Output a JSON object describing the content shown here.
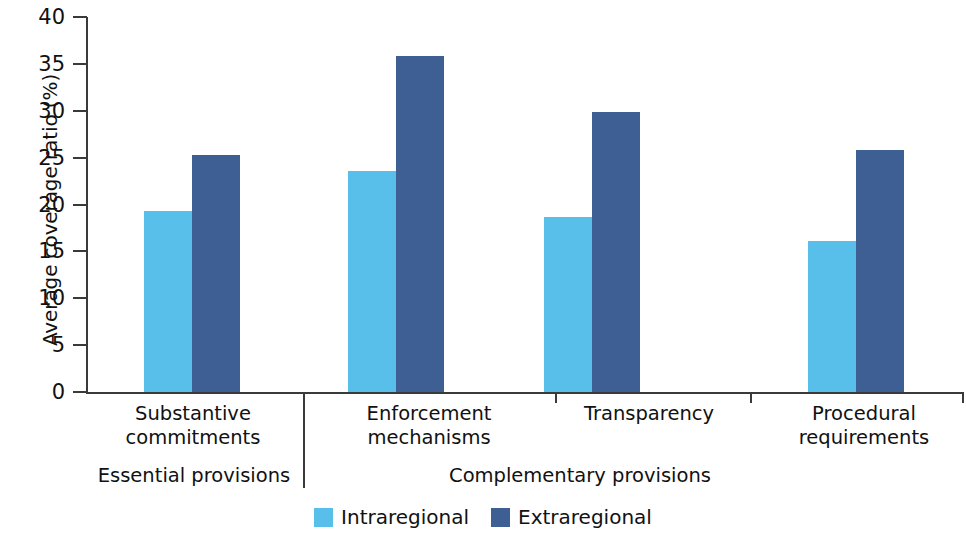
{
  "chart_data": {
    "type": "bar",
    "title": "",
    "subtitle": "",
    "xlabel": "",
    "ylabel": "Average coverage ratio (%)",
    "ylim": [
      0,
      40
    ],
    "ytick_step": 5,
    "yticks": [
      0,
      5,
      10,
      15,
      20,
      25,
      30,
      35,
      40
    ],
    "ytick_labels": [
      "0",
      "5",
      "10",
      "15",
      "20",
      "25",
      "30",
      "35",
      "40"
    ],
    "grid": false,
    "legend_position": "bottom-center",
    "categories": [
      "Substantive commitments",
      "Enforcement mechanisms",
      "Transparency",
      "Procedural requirements"
    ],
    "category_lines": [
      [
        "Substantive",
        "commitments"
      ],
      [
        "Enforcement",
        "mechanisms"
      ],
      [
        "Transparency"
      ],
      [
        "Procedural",
        "requirements"
      ]
    ],
    "series": [
      {
        "name": "Intraregional",
        "color": "#57bfea",
        "values": [
          19.4,
          23.6,
          18.7,
          16.2
        ]
      },
      {
        "name": "Extraregional",
        "color": "#3d5f94",
        "values": [
          25.3,
          35.9,
          29.9,
          25.8
        ]
      }
    ],
    "groupings": [
      {
        "label": "Essential provisions",
        "categories": [
          "Substantive commitments"
        ]
      },
      {
        "label": "Complementary provisions",
        "categories": [
          "Enforcement mechanisms",
          "Transparency",
          "Procedural requirements"
        ]
      }
    ]
  },
  "axis": {
    "y_title": "Average coverage ratio (%)",
    "y_labels": [
      "40",
      "35",
      "30",
      "25",
      "20",
      "15",
      "10",
      "5",
      "0"
    ]
  },
  "categories": {
    "c0_line1": "Substantive",
    "c0_line2": "commitments",
    "c1_line1": "Enforcement",
    "c1_line2": "mechanisms",
    "c2_line1": "Transparency",
    "c2_line2": "",
    "c3_line1": "Procedural",
    "c3_line2": "requirements"
  },
  "sections": {
    "essential": "Essential provisions",
    "complementary": "Complementary provisions"
  },
  "legend": {
    "items": [
      {
        "label": "Intraregional",
        "color": "#57bfea"
      },
      {
        "label": "Extraregional",
        "color": "#3d5f94"
      }
    ],
    "intra_label": "Intraregional",
    "extra_label": "Extraregional"
  },
  "colors": {
    "intraregional": "#57bfea",
    "extraregional": "#3d5f94",
    "axis": "#3a3a3a",
    "text": "#111111"
  }
}
